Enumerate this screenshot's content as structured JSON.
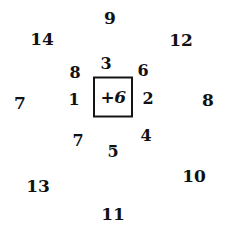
{
  "diagram": {
    "background_color": "#ffffff",
    "text_color": "#111111",
    "center": {
      "label": "+6",
      "box": {
        "x": 113,
        "y": 97,
        "width": 40,
        "height": 41,
        "border_color": "#141414",
        "border_width": 2,
        "fill": "#ffffff"
      }
    },
    "inner_ring": [
      {
        "label": "3",
        "position": "top",
        "x": 106,
        "y": 64
      },
      {
        "label": "6",
        "position": "top-right",
        "x": 143,
        "y": 71
      },
      {
        "label": "2",
        "position": "right",
        "x": 148,
        "y": 99
      },
      {
        "label": "4",
        "position": "bottom-right",
        "x": 146,
        "y": 136
      },
      {
        "label": "5",
        "position": "bottom",
        "x": 113,
        "y": 152
      },
      {
        "label": "7",
        "position": "bottom-left",
        "x": 78,
        "y": 141
      },
      {
        "label": "1",
        "position": "left",
        "x": 74,
        "y": 100
      },
      {
        "label": "8",
        "position": "top-left",
        "x": 75,
        "y": 73
      }
    ],
    "outer_ring": [
      {
        "label": "9",
        "position": "top",
        "x": 110,
        "y": 18
      },
      {
        "label": "12",
        "position": "top-right",
        "x": 181,
        "y": 40
      },
      {
        "label": "8",
        "position": "right",
        "x": 208,
        "y": 100
      },
      {
        "label": "10",
        "position": "bottom-right",
        "x": 194,
        "y": 176
      },
      {
        "label": "11",
        "position": "bottom",
        "x": 113,
        "y": 214
      },
      {
        "label": "13",
        "position": "bottom-left",
        "x": 38,
        "y": 186
      },
      {
        "label": "7",
        "position": "left",
        "x": 20,
        "y": 103
      },
      {
        "label": "14",
        "position": "top-left",
        "x": 42,
        "y": 39
      }
    ]
  }
}
